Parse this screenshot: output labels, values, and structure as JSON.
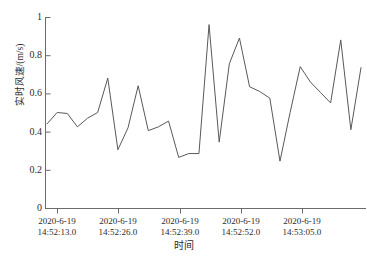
{
  "chart_data": {
    "type": "line",
    "title": "",
    "xlabel": "时间",
    "ylabel": "实时风速/(m/s)",
    "ylim": [
      0,
      1
    ],
    "yticks": [
      0,
      0.2,
      0.4,
      0.6,
      0.8,
      1
    ],
    "ytick_labels": [
      "0",
      "0.2",
      "0.4",
      "0.6",
      "0.8",
      "1"
    ],
    "xtick_labels": [
      {
        "line1": "2020-6-19",
        "line2": "14:52:13.0"
      },
      {
        "line1": "2020-6-19",
        "line2": "14:52:26.0"
      },
      {
        "line1": "2020-6-19",
        "line2": "14:52:39.0"
      },
      {
        "line1": "2020-6-19",
        "line2": "14:52:52.0"
      },
      {
        "line1": "2020-6-19",
        "line2": "14:53:05.0"
      }
    ],
    "xtick_positions_px": [
      57,
      118,
      180,
      241,
      302
    ],
    "grid": false,
    "legend": null,
    "series": [
      {
        "name": "实时风速",
        "color": "#555555",
        "values": [
          0.44,
          0.5,
          0.495,
          0.425,
          0.47,
          0.5,
          0.68,
          0.305,
          0.42,
          0.64,
          0.405,
          0.425,
          0.455,
          0.265,
          0.285,
          0.285,
          0.96,
          0.345,
          0.755,
          0.89,
          0.635,
          0.61,
          0.575,
          0.245,
          0.5,
          0.74,
          0.66,
          0.605,
          0.55,
          0.88,
          0.41,
          0.735
        ]
      }
    ],
    "x_index": [
      0,
      1,
      2,
      3,
      4,
      5,
      6,
      7,
      8,
      9,
      10,
      11,
      12,
      13,
      14,
      15,
      16,
      17,
      18,
      19,
      20,
      21,
      22,
      23,
      24,
      25,
      26,
      27,
      28,
      29,
      30,
      31
    ],
    "x_pixel_start": 47,
    "x_pixel_end": 361,
    "axis_color": "#6b6b6b",
    "line_color": "#595959",
    "background": "#ffffff"
  },
  "plot": {
    "left_px": 45,
    "right_px": 366,
    "top_px": 17,
    "bottom_px": 208
  }
}
